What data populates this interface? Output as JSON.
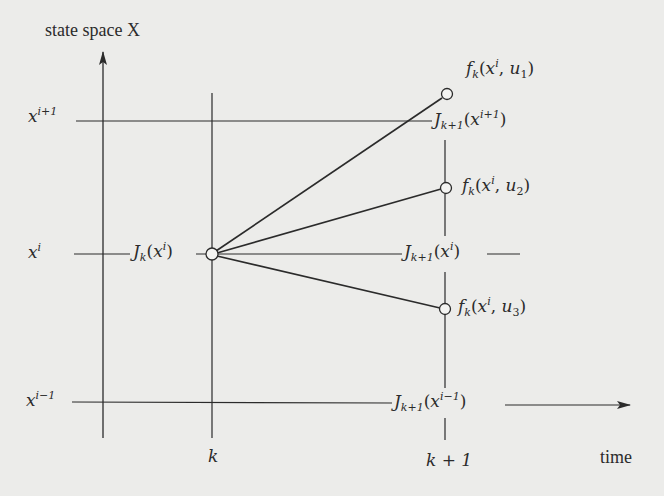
{
  "diagram": {
    "title_y_axis": "state space X",
    "title_x_axis": "time",
    "state_labels": {
      "x_i_plus_1": {
        "base": "x",
        "sup": "i+1"
      },
      "x_i": {
        "base": "x",
        "sup": "i"
      },
      "x_i_minus_1": {
        "base": "x",
        "sup": "i−1"
      }
    },
    "time_labels": {
      "k": "k",
      "k_plus_1": "k + 1"
    },
    "cost_labels": {
      "J_k_xi": {
        "func": "J",
        "sub": "k",
        "arg_base": "x",
        "arg_sup": "i"
      },
      "J_k1_xi1": {
        "func": "J",
        "sub": "k+1",
        "arg_base": "x",
        "arg_sup": "i+1"
      },
      "J_k1_xi": {
        "func": "J",
        "sub": "k+1",
        "arg_base": "x",
        "arg_sup": "i"
      },
      "J_k1_xim1": {
        "func": "J",
        "sub": "k+1",
        "arg_base": "x",
        "arg_sup": "i−1"
      }
    },
    "transition_labels": [
      {
        "func": "f",
        "sub": "k",
        "arg_base": "x",
        "arg_sup": "i",
        "control": "u",
        "control_sub": "1"
      },
      {
        "func": "f",
        "sub": "k",
        "arg_base": "x",
        "arg_sup": "i",
        "control": "u",
        "control_sub": "2"
      },
      {
        "func": "f",
        "sub": "k",
        "arg_base": "x",
        "arg_sup": "i",
        "control": "u",
        "control_sub": "3"
      }
    ],
    "punct": {
      "open": "(",
      "close": ")",
      "comma": ", "
    },
    "colors": {
      "background": "#ececea",
      "ink": "#2b2b2b"
    }
  }
}
